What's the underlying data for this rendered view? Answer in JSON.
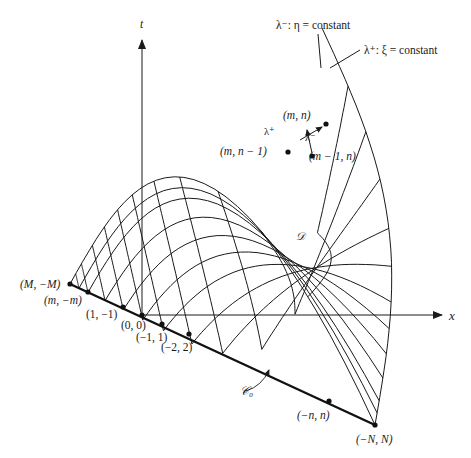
{
  "figure": {
    "axes": {
      "t_label": "t",
      "x_label": "x",
      "origin": [
        142,
        315
      ],
      "t_axis_top": 38,
      "x_axis_right": 440
    },
    "characteristics": {
      "lambda_minus_label": "λ⁻: η = constant",
      "lambda_plus_label": "λ⁺: ξ = constant",
      "lambda_plus_arrow_label": "λ⁺",
      "lambda_minus_arrow_label": "λ⁻"
    },
    "region_label": "𝒟",
    "curve_label": "𝒞₀",
    "boundary": {
      "start": [
        70,
        284
      ],
      "end": [
        375,
        425
      ]
    },
    "grid": {
      "plus_curves": 12,
      "minus_curves": 11
    },
    "points": [
      {
        "label": "(M, −M)",
        "x": 70,
        "y": 284
      },
      {
        "label": "(m, −m)",
        "x": 88,
        "y": 292
      },
      {
        "label": "(1, −1)",
        "x": 123,
        "y": 307
      },
      {
        "label": "(0, 0)",
        "x": 142,
        "y": 315
      },
      {
        "label": "(−1, 1)",
        "x": 162,
        "y": 324
      },
      {
        "label": "(−2, 2)",
        "x": 189,
        "y": 334
      },
      {
        "label": "(−n, n)",
        "x": 329,
        "y": 401
      },
      {
        "label": "(−N, N)",
        "x": 375,
        "y": 425
      },
      {
        "label": "(m, n − 1)",
        "x": 288,
        "y": 152
      },
      {
        "label": "(m, n)",
        "x": 326,
        "y": 124
      },
      {
        "label": "(m − 1, n)",
        "x": 312,
        "y": 156
      }
    ],
    "labels": {
      "M_minusM": "(M, −M)",
      "m_minusm": "(m, −m)",
      "one_minusone": "(1, −1)",
      "zero_zero": "(0, 0)",
      "minusone_one": "(−1, 1)",
      "minustwo_two": "(−2, 2)",
      "minusn_n": "(−n, n)",
      "minusN_N": "(−N, N)",
      "m_nminus1": "(m, n − 1)",
      "m_n": "(m, n)",
      "mminus1_n": "(m − 1, n)"
    }
  }
}
